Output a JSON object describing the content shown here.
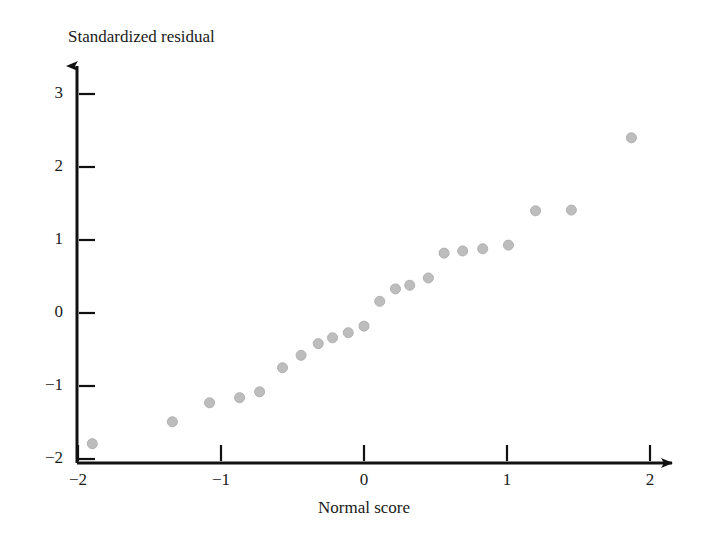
{
  "chart_data": {
    "type": "scatter",
    "title": "",
    "xlabel": "Normal score",
    "ylabel": "Standardized residual",
    "xlim": [
      -2.2,
      2.2
    ],
    "ylim": [
      -2.1,
      3.35
    ],
    "xticks": [
      -2,
      -1,
      0,
      1,
      2
    ],
    "xtick_labels": [
      "−2",
      "−1",
      "0",
      "1",
      "2"
    ],
    "yticks": [
      -2,
      -1,
      0,
      1,
      2,
      3
    ],
    "ytick_labels": [
      "−2",
      "−1",
      "0",
      "1",
      "2",
      "3"
    ],
    "grid": false,
    "legend": null,
    "marker": {
      "shape": "circle",
      "color": "#bdbdbd",
      "edge_color": "#b0b0b0",
      "size_px": 10
    },
    "axis_color": "#111111",
    "series": [
      {
        "name": "standardized residuals vs normal scores",
        "points": [
          {
            "x": -1.9,
            "y": -1.79
          },
          {
            "x": -1.34,
            "y": -1.49
          },
          {
            "x": -1.08,
            "y": -1.23
          },
          {
            "x": -0.87,
            "y": -1.16
          },
          {
            "x": -0.73,
            "y": -1.08
          },
          {
            "x": -0.57,
            "y": -0.75
          },
          {
            "x": -0.44,
            "y": -0.58
          },
          {
            "x": -0.32,
            "y": -0.42
          },
          {
            "x": -0.22,
            "y": -0.34
          },
          {
            "x": -0.11,
            "y": -0.27
          },
          {
            "x": 0.0,
            "y": -0.18
          },
          {
            "x": 0.11,
            "y": 0.16
          },
          {
            "x": 0.22,
            "y": 0.33
          },
          {
            "x": 0.32,
            "y": 0.38
          },
          {
            "x": 0.45,
            "y": 0.48
          },
          {
            "x": 0.56,
            "y": 0.82
          },
          {
            "x": 0.69,
            "y": 0.85
          },
          {
            "x": 0.83,
            "y": 0.88
          },
          {
            "x": 1.01,
            "y": 0.93
          },
          {
            "x": 1.2,
            "y": 1.4
          },
          {
            "x": 1.45,
            "y": 1.41
          },
          {
            "x": 1.87,
            "y": 2.4
          }
        ]
      }
    ]
  }
}
